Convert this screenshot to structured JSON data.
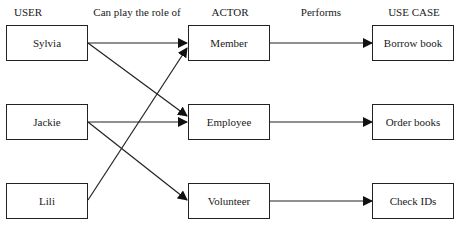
{
  "headers": {
    "user": "USER",
    "role": "Can play the role of",
    "actor": "ACTOR",
    "performs": "Performs",
    "use_case": "USE CASE"
  },
  "users": [
    "Sylvia",
    "Jackie",
    "Lili"
  ],
  "actors": [
    "Member",
    "Employee",
    "Volunteer"
  ],
  "use_cases": [
    "Borrow book",
    "Order books",
    "Check IDs"
  ],
  "user_actor_links": [
    {
      "from": "Sylvia",
      "to": "Member"
    },
    {
      "from": "Sylvia",
      "to": "Employee"
    },
    {
      "from": "Jackie",
      "to": "Employee"
    },
    {
      "from": "Jackie",
      "to": "Volunteer"
    },
    {
      "from": "Lili",
      "to": "Member"
    }
  ],
  "actor_usecase_links": [
    {
      "from": "Member",
      "to": "Borrow book"
    },
    {
      "from": "Employee",
      "to": "Order books"
    },
    {
      "from": "Volunteer",
      "to": "Check IDs"
    }
  ]
}
